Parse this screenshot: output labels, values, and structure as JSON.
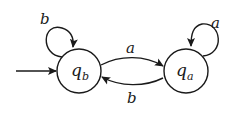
{
  "diagram": {
    "type": "finite-automaton",
    "states": [
      {
        "id": "qb",
        "label": "q",
        "subscript": "b",
        "initial": true,
        "cx": 79,
        "cy": 71
      },
      {
        "id": "qa",
        "label": "q",
        "subscript": "a",
        "initial": false,
        "cx": 186,
        "cy": 71
      }
    ],
    "transitions": [
      {
        "from": "qb",
        "to": "qb",
        "symbol": "b"
      },
      {
        "from": "qb",
        "to": "qa",
        "symbol": "a"
      },
      {
        "from": "qa",
        "to": "qb",
        "symbol": "b"
      },
      {
        "from": "qa",
        "to": "qa",
        "symbol": "a"
      }
    ],
    "labels": {
      "qb_loop": "b",
      "qb_to_qa": "a",
      "qa_to_qb": "b",
      "qa_loop": "a",
      "qb_main": "q",
      "qb_sub": "b",
      "qa_main": "q",
      "qa_sub": "a"
    },
    "colors": {
      "stroke": "#1a1a1a",
      "background": "#ffffff"
    }
  }
}
